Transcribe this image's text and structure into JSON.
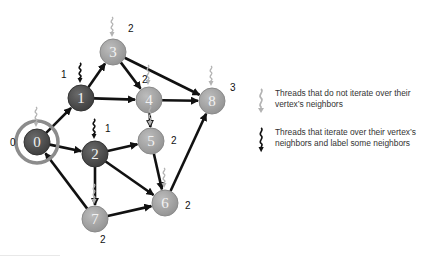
{
  "figure": {
    "type": "directed-graph",
    "colors": {
      "dark_node": "#555555",
      "light_node": "#a6a6a6",
      "source_ring": "#8c8c8c",
      "edge": "#111111",
      "dark_thread": "#111111",
      "light_thread": "#b3b3b3"
    },
    "nodes": [
      {
        "id": "0",
        "label": "0",
        "level": "0",
        "x": 37,
        "y": 142,
        "style": "dark",
        "thread": "light",
        "source": true
      },
      {
        "id": "1",
        "label": "1",
        "level": "1",
        "x": 81,
        "y": 98,
        "style": "dark",
        "thread": "dark"
      },
      {
        "id": "2",
        "label": "2",
        "level": "1",
        "x": 95,
        "y": 154,
        "style": "dark",
        "thread": "dark"
      },
      {
        "id": "3",
        "label": "3",
        "level": "2",
        "x": 113,
        "y": 52,
        "style": "light",
        "thread": "light"
      },
      {
        "id": "4",
        "label": "4",
        "level": "2",
        "x": 149,
        "y": 100,
        "style": "light",
        "thread": "light"
      },
      {
        "id": "5",
        "label": "5",
        "level": "2",
        "x": 151,
        "y": 141,
        "style": "light",
        "thread": "light"
      },
      {
        "id": "6",
        "label": "6",
        "level": "2",
        "x": 165,
        "y": 203,
        "style": "light",
        "thread": "light"
      },
      {
        "id": "7",
        "label": "7",
        "level": "2",
        "x": 95,
        "y": 219,
        "style": "light",
        "thread": "light"
      },
      {
        "id": "8",
        "label": "8",
        "level": "3",
        "x": 212,
        "y": 101,
        "style": "light",
        "thread": "light"
      }
    ],
    "edges": [
      [
        "0",
        "1"
      ],
      [
        "0",
        "2"
      ],
      [
        "7",
        "0"
      ],
      [
        "1",
        "3"
      ],
      [
        "1",
        "4"
      ],
      [
        "3",
        "4"
      ],
      [
        "3",
        "8"
      ],
      [
        "4",
        "8"
      ],
      [
        "4",
        "5"
      ],
      [
        "2",
        "5"
      ],
      [
        "2",
        "6"
      ],
      [
        "2",
        "7"
      ],
      [
        "5",
        "6"
      ],
      [
        "7",
        "6"
      ],
      [
        "6",
        "8"
      ]
    ]
  },
  "legend": {
    "items": [
      {
        "icon": "light-thread-icon",
        "text": "Threads that do not iterate over their vertex’s neighbors"
      },
      {
        "icon": "dark-thread-icon",
        "text": "Threads that iterate over their vertex’s neighbors and label some neighbors"
      }
    ]
  }
}
